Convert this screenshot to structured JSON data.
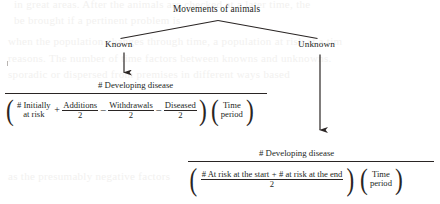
{
  "diagram": {
    "title": "Movements of animals",
    "branches": [
      {
        "label": "Known"
      },
      {
        "label": "Unknown"
      }
    ]
  },
  "known_formula": {
    "numerator": "# Developing disease",
    "term1": {
      "line1": "# Initially",
      "line2": "at risk"
    },
    "op1": "+",
    "term2": {
      "top": "Additions",
      "bottom": "2"
    },
    "op2": "–",
    "term3": {
      "top": "Withdrawals",
      "bottom": "2"
    },
    "op3": "–",
    "term4": {
      "top": "Diseased",
      "bottom": "2"
    },
    "time": {
      "line1": "Time",
      "line2": "period"
    },
    "paren_open": "(",
    "paren_close": ")"
  },
  "unknown_formula": {
    "numerator": "# Developing disease",
    "frac_top_a": "# At risk at the start",
    "frac_top_op": "+",
    "frac_top_b": "# at risk at the end",
    "frac_bottom": "2",
    "time": {
      "line1": "Time",
      "line2": "period"
    },
    "paren_open": "(",
    "paren_close": ")"
  },
  "ghost_text": {
    "g1": "in great areas. After the animals are checked at a later time, the",
    "g2": "be brought if a pertinent problem is",
    "g3": "when the population changes through time, a population at risk at a tim",
    "g4": "reasons. The number of time factors between knowns and unknowns.",
    "g5": "sporadic or dispersed from premises   in different ways based",
    "g6": "as the presumably negative factors"
  },
  "colors": {
    "ink": "#231f1e",
    "rule": "#2a2524",
    "background": "#ffffff",
    "ghost": "#f2f1ef"
  }
}
